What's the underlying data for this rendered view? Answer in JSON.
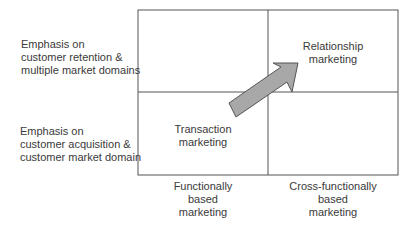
{
  "rows": [
    {
      "label_lines": [
        "Emphasis on",
        "customer retention &",
        "multiple market domains"
      ]
    },
    {
      "label_lines": [
        "Emphasis on",
        "customer acquisition &",
        "customer market domain"
      ]
    }
  ],
  "columns": [
    {
      "label_lines": [
        "Functionally",
        "based",
        "marketing"
      ]
    },
    {
      "label_lines": [
        "Cross-functionally",
        "based",
        "marketing"
      ]
    }
  ],
  "cells": {
    "top_right": {
      "label_lines": [
        "Relationship",
        "marketing"
      ]
    },
    "bottom_left": {
      "label_lines": [
        "Transaction",
        "marketing"
      ]
    }
  },
  "arrow": {
    "from": "Transaction marketing",
    "to": "Relationship marketing",
    "fill": "#a8a8a8",
    "stroke": "#555555"
  },
  "colors": {
    "grid": "#555555",
    "text": "#3a3a3a"
  }
}
